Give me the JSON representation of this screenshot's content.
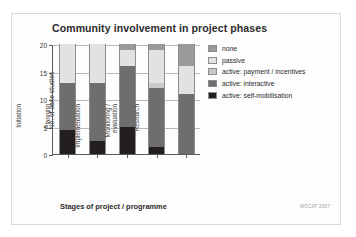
{
  "chart_data": {
    "type": "bar",
    "stacked": true,
    "title": "Community involvement in project phases",
    "xlabel": "Stages of project / programme",
    "ylabel": "No. of case studies",
    "ylim": [
      0,
      20
    ],
    "yticks": [
      0,
      5,
      10,
      15,
      20
    ],
    "ytick_labels": [
      "0",
      "5",
      "10",
      "15",
      "20"
    ],
    "grid": true,
    "legend_position": "right",
    "categories": [
      "Initiation",
      "Planning",
      "Implementation",
      "Monitoring /\nevaluation",
      "Research"
    ],
    "series": [
      {
        "name": "active: self-mobilisation",
        "color": "#231f20",
        "values": [
          4.3,
          2.3,
          5.0,
          1.2,
          0
        ]
      },
      {
        "name": "active: interactive",
        "color": "#6e6e6e",
        "values": [
          8.7,
          10.7,
          11.0,
          10.8,
          11.0
        ]
      },
      {
        "name": "active: payment / incentives",
        "color": "#c9c9c9",
        "values": [
          0,
          0,
          0,
          1.0,
          0
        ]
      },
      {
        "name": "passive",
        "color": "#e2e2e2",
        "values": [
          7.0,
          7.0,
          3.0,
          6.0,
          5.0
        ]
      },
      {
        "name": "none",
        "color": "#9a9a9a",
        "values": [
          0,
          0,
          1.0,
          1.0,
          4.0
        ]
      }
    ],
    "totals": [
      20,
      20,
      20,
      20,
      20
    ],
    "credit": "WOCAT 2007"
  },
  "legend": {
    "entries": [
      {
        "label": "none",
        "color": "#9a9a9a"
      },
      {
        "label": "passive",
        "color": "#e2e2e2"
      },
      {
        "label": "active: payment / incentives",
        "color": "#c9c9c9"
      },
      {
        "label": "active: interactive",
        "color": "#6e6e6e"
      },
      {
        "label": "active: self-mobilisation",
        "color": "#231f20"
      }
    ]
  }
}
